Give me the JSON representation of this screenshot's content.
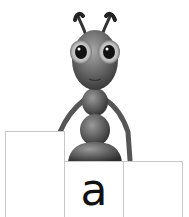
{
  "scene": {
    "character": "ant",
    "boxes": [
      {
        "position": "left",
        "letter": ""
      },
      {
        "position": "middle",
        "letter": "a"
      },
      {
        "position": "right",
        "letter": ""
      }
    ]
  },
  "colors": {
    "background": "#ffffff",
    "box_border": "#c8c8c8",
    "letter": "#111111",
    "ant_body": "#5a5a5a"
  }
}
